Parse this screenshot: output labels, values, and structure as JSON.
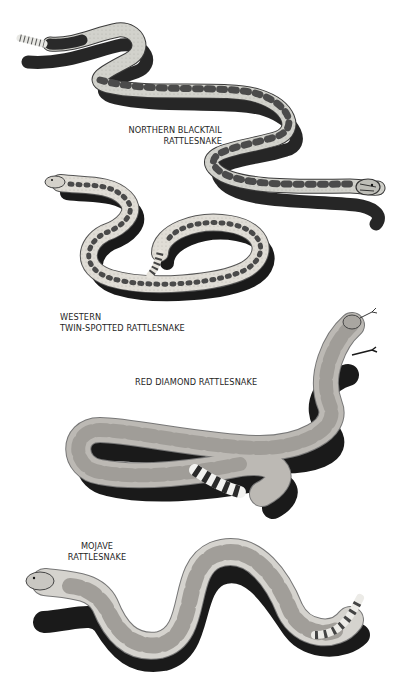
{
  "plate": {
    "background": "#ffffff",
    "ink_color": "#1f1f1f",
    "species": [
      {
        "id": "northern-blacktail",
        "label_lines": [
          "NORTHERN BLACKTAIL",
          "RATTLESNAKE"
        ],
        "body_color": "#cfcfc9",
        "pattern_color": "#555555",
        "tail": "black"
      },
      {
        "id": "western-twin-spotted",
        "label_lines": [
          "WESTERN",
          "TWIN-SPOTTED RATTLESNAKE"
        ],
        "body_color": "#dedbd4",
        "pattern_color": "#5a5a5a",
        "tail": "banded"
      },
      {
        "id": "red-diamond",
        "label_lines": [
          "RED DIAMOND RATTLESNAKE"
        ],
        "body_color": "#b9b6b1",
        "pattern_color": "#9a9793",
        "tail": "black-and-white banded"
      },
      {
        "id": "mojave",
        "label_lines": [
          "MOJAVE",
          "RATTLESNAKE"
        ],
        "body_color": "#d4d2cd",
        "pattern_color": "#9d9a95",
        "tail": "banded"
      }
    ]
  }
}
